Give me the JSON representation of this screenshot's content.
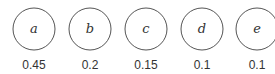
{
  "diagram": {
    "nodes": [
      {
        "label": "a",
        "value": "0.45"
      },
      {
        "label": "b",
        "value": "0.2"
      },
      {
        "label": "c",
        "value": "0.15"
      },
      {
        "label": "d",
        "value": "0.1"
      },
      {
        "label": "e",
        "value": "0.1"
      }
    ],
    "stroke_color": "#555555"
  }
}
